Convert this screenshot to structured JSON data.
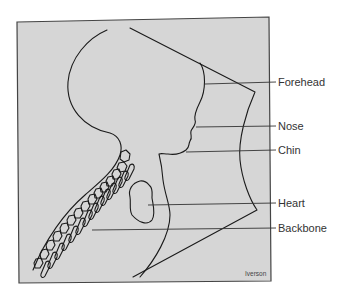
{
  "figure": {
    "background_color": "#d6d6d6",
    "frame_color": "#444444",
    "line_color": "#1a1a1a"
  },
  "labels": [
    {
      "id": "forehead",
      "text": "Forehead",
      "y": 82
    },
    {
      "id": "nose",
      "text": "Nose",
      "y": 126
    },
    {
      "id": "chin",
      "text": "Chin",
      "y": 150
    },
    {
      "id": "heart",
      "text": "Heart",
      "y": 203
    },
    {
      "id": "backbone",
      "text": "Backbone",
      "y": 228
    }
  ],
  "credit": "Iverson"
}
